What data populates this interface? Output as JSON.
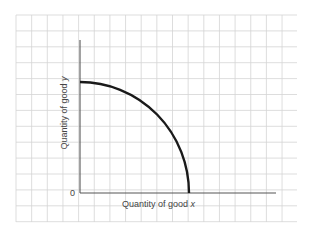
{
  "diagram": {
    "type": "production-possibility-frontier",
    "origin_label": "0",
    "x_axis_label": "Quantity of good ",
    "x_axis_var": "x",
    "y_axis_label": "Quantity of good ",
    "y_axis_var": "y",
    "curve": "concave quarter-ellipse from y-axis intercept to x-axis intercept",
    "background": "graph-paper grid",
    "colors": {
      "grid": "#d4d4d4",
      "axis": "#555555",
      "curve": "#1a1a1a",
      "text": "#444444"
    }
  }
}
